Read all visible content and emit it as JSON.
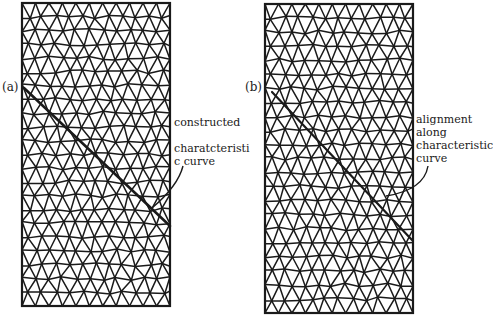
{
  "figure": {
    "panels": [
      {
        "id": "a",
        "label": "(a)",
        "label_pos": [
          2,
          88
        ],
        "rect": [
          22,
          3,
          148,
          303
        ],
        "cols": 11,
        "rows": 22,
        "curve": {
          "from": [
            24,
            88
          ],
          "to": [
            170,
            226
          ],
          "width": 2.6
        },
        "annotation": {
          "lines": [
            "constructed",
            "",
            "charatcteristi",
            "c curve"
          ],
          "pos": [
            174,
            116
          ],
          "leader": "M 183 166 Q 178 186 152 208"
        }
      },
      {
        "id": "b",
        "label": "(b)",
        "label_pos": [
          245,
          88
        ],
        "rect": [
          265,
          4,
          148,
          309
        ],
        "cols": 11,
        "rows": 22,
        "curve": {
          "from": [
            272,
            92
          ],
          "to": [
            412,
            240
          ],
          "width": 2.2
        },
        "annotation": {
          "lines": [
            "alignment",
            "along",
            "characteristic",
            "curve"
          ],
          "pos": [
            416,
            113
          ],
          "leader": "M 428 166 Q 424 190 386 196"
        }
      }
    ],
    "colors": {
      "stroke": "#1a1a1a",
      "background": "#ffffff"
    }
  }
}
